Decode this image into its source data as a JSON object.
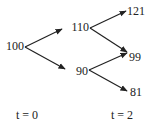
{
  "diagram": {
    "type": "binomial-tree",
    "nodes": [
      {
        "id": "n0",
        "label": "100",
        "x": 24,
        "y": 47,
        "anchor": "end"
      },
      {
        "id": "n1u",
        "label": "110",
        "x": 89,
        "y": 28,
        "anchor": "end"
      },
      {
        "id": "n1d",
        "label": "90",
        "x": 88,
        "y": 72,
        "anchor": "end"
      },
      {
        "id": "n2uu",
        "label": "121",
        "x": 127,
        "y": 12,
        "anchor": "start"
      },
      {
        "id": "n2ud",
        "label": "99",
        "x": 129,
        "y": 58,
        "anchor": "start"
      },
      {
        "id": "n2dd",
        "label": "81",
        "x": 130,
        "y": 93,
        "anchor": "start"
      }
    ],
    "edges": [
      {
        "from": "n0",
        "to": "n1u",
        "x1": 25,
        "y1": 47,
        "x2": 62,
        "y2": 29
      },
      {
        "from": "n0",
        "to": "n1d",
        "x1": 25,
        "y1": 47,
        "x2": 65,
        "y2": 69
      },
      {
        "from": "n1u",
        "to": "n2uu",
        "x1": 90,
        "y1": 28,
        "x2": 126,
        "y2": 11
      },
      {
        "from": "n1u",
        "to": "n2ud",
        "x1": 90,
        "y1": 28,
        "x2": 127,
        "y2": 52
      },
      {
        "from": "n1d",
        "to": "n2ud",
        "x1": 89,
        "y1": 70,
        "x2": 127,
        "y2": 53
      },
      {
        "from": "n1d",
        "to": "n2dd",
        "x1": 89,
        "y1": 70,
        "x2": 127,
        "y2": 91
      }
    ],
    "time_labels": [
      {
        "label": "t = 0",
        "x": 27,
        "y": 119
      },
      {
        "label": "t = 2",
        "x": 122,
        "y": 119
      }
    ],
    "colors": {
      "line": "#222222",
      "text": "#222222",
      "background": "#ffffff"
    }
  }
}
